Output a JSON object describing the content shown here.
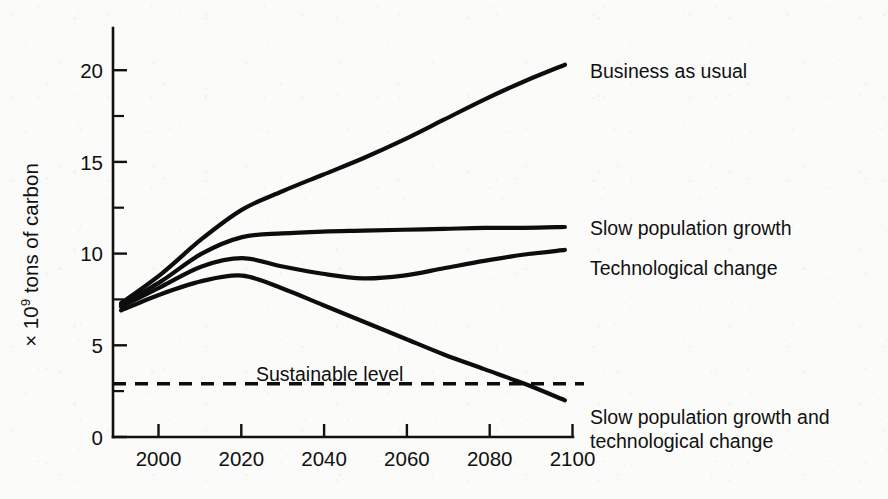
{
  "chart_data": {
    "type": "line",
    "title": "",
    "xlabel": "",
    "ylabel_prefix": "× 10",
    "ylabel_exponent": "9",
    "ylabel_suffix": " tons of carbon",
    "ylabel_full": "× 10⁹ tons of carbon",
    "xlim": [
      1988,
      2102
    ],
    "ylim": [
      0,
      22.4
    ],
    "grid": false,
    "legend_position": "inline-right-of-curve-ends",
    "x_ticks": [
      "2000",
      "2020",
      "2040",
      "2060",
      "2080",
      "2100"
    ],
    "x_tick_values": [
      2000,
      2020,
      2040,
      2060,
      2080,
      2100
    ],
    "y_ticks": [
      "0",
      "5",
      "10",
      "15",
      "20"
    ],
    "y_tick_values": [
      0,
      5,
      10,
      15,
      20
    ],
    "y_minor_tick_values": [
      2.5,
      7.5,
      12.5,
      17.5
    ],
    "x": [
      1990,
      2000,
      2010,
      2020,
      2030,
      2040,
      2050,
      2060,
      2070,
      2080,
      2090,
      2100
    ],
    "series": [
      {
        "name": "Business as usual",
        "label": "Business as usual",
        "values": [
          7.3,
          8.9,
          10.8,
          12.4,
          13.4,
          14.3,
          15.2,
          16.2,
          17.3,
          18.4,
          19.4,
          20.3
        ]
      },
      {
        "name": "Slow population growth",
        "label": "Slow population growth",
        "values": [
          7.2,
          8.5,
          10.0,
          10.9,
          11.1,
          11.2,
          11.25,
          11.3,
          11.35,
          11.4,
          11.4,
          11.45
        ]
      },
      {
        "name": "Technological change",
        "label": "Technological change",
        "values": [
          7.1,
          8.2,
          9.3,
          9.75,
          9.3,
          8.9,
          8.65,
          8.8,
          9.2,
          9.6,
          9.95,
          10.2
        ]
      },
      {
        "name": "Slow population growth and technological change",
        "label_line_1": "Slow population growth and",
        "label_line_2": "technological change",
        "values": [
          6.9,
          7.8,
          8.5,
          8.8,
          8.1,
          7.2,
          6.3,
          5.4,
          4.5,
          3.7,
          2.9,
          2.0
        ]
      }
    ],
    "annotations": [
      {
        "name": "sustainable-level",
        "label": "Sustainable level",
        "type": "horizontal-dashed-line",
        "value": 2.9
      }
    ]
  }
}
